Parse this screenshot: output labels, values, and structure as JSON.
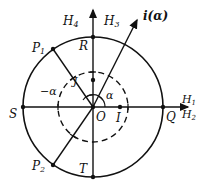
{
  "diagram": {
    "type": "unit-circle-geometry",
    "colors": {
      "stroke": "#111111",
      "background": "#ffffff"
    },
    "center": {
      "label": "O"
    },
    "points": {
      "R": "R",
      "S": "S",
      "T": "T",
      "Q": "Q",
      "I": "I",
      "J": "J",
      "P1": "P",
      "P1_sub": "1",
      "P2": "P",
      "P2_sub": "2"
    },
    "angles": {
      "alpha": "α",
      "neg_alpha": "−α"
    },
    "axes": {
      "H1": "H",
      "H1_sub": "1",
      "H2": "H",
      "H2_sub": "2",
      "H3": "H",
      "H3_sub": "3",
      "H4": "H",
      "H4_sub": "4",
      "i_alpha": "i(α)"
    }
  }
}
